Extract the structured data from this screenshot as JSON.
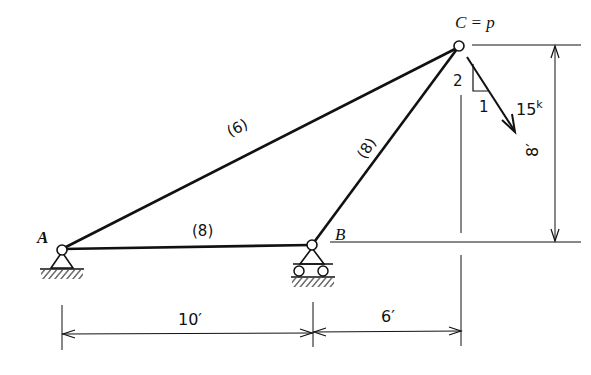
{
  "diagram": {
    "type": "truss",
    "joints": {
      "A": {
        "label": "A",
        "support": "pin"
      },
      "B": {
        "label": "B",
        "support": "roller"
      },
      "C": {
        "label": "C = p"
      }
    },
    "members": [
      {
        "from": "A",
        "to": "C",
        "label": "(6)"
      },
      {
        "from": "A",
        "to": "B",
        "label": "(8)"
      },
      {
        "from": "B",
        "to": "C",
        "label": "(8)"
      }
    ],
    "load": {
      "magnitude": "15",
      "unit": "k",
      "slope_rise": "2",
      "slope_run": "1"
    },
    "dimensions": {
      "AB": "10′",
      "B_to_C": "6′",
      "height": "8′"
    }
  }
}
